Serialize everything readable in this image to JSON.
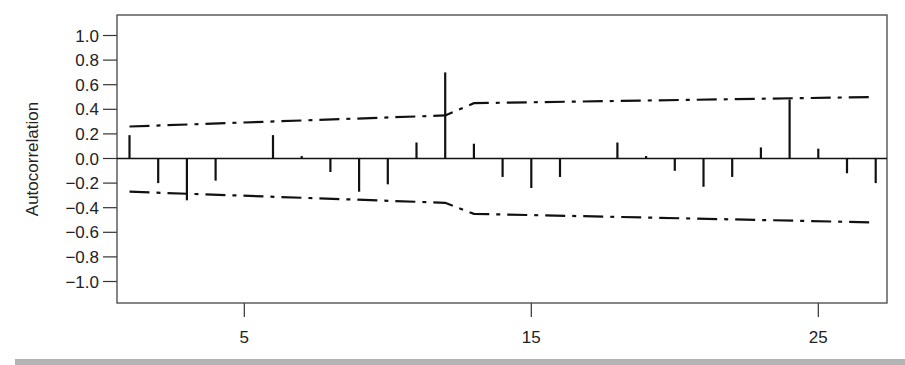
{
  "chart_data": {
    "type": "bar",
    "subtype": "acf-stem",
    "title": "",
    "xlabel": "",
    "ylabel": "Autocorrelation",
    "ylim": [
      -1.1,
      1.1
    ],
    "xlim": [
      0.5,
      27.4
    ],
    "yticks": [
      1.0,
      0.8,
      0.6,
      0.4,
      0.2,
      0.0,
      -0.2,
      -0.4,
      -0.6,
      -0.8,
      -1.0
    ],
    "ytick_labels": [
      "1.0",
      "0.8",
      "0.6",
      "0.4",
      "0.2",
      "0.0",
      "−0.2",
      "−0.4",
      "−0.6",
      "−0.8",
      "−1.0"
    ],
    "xticks": [
      5,
      15,
      25
    ],
    "xtick_labels": [
      "5",
      "15",
      "25"
    ],
    "grid": false,
    "legend": null,
    "lags": [
      1,
      2,
      3,
      4,
      5,
      6,
      7,
      8,
      9,
      10,
      11,
      12,
      13,
      14,
      15,
      16,
      17,
      18,
      19,
      20,
      21,
      22,
      23,
      24,
      25,
      26,
      27
    ],
    "values": [
      0.19,
      -0.2,
      -0.34,
      -0.18,
      0.0,
      0.19,
      0.02,
      -0.11,
      -0.27,
      -0.21,
      0.13,
      0.7,
      0.12,
      -0.15,
      -0.24,
      -0.15,
      0.0,
      0.13,
      0.02,
      -0.1,
      -0.23,
      -0.15,
      0.09,
      0.48,
      0.08,
      -0.12,
      -0.2
    ],
    "confidence_bands": {
      "style": "dash-dot",
      "upper": {
        "x": [
          1,
          12,
          13,
          27
        ],
        "y": [
          0.26,
          0.35,
          0.45,
          0.5
        ]
      },
      "lower": {
        "x": [
          1,
          12,
          13,
          27
        ],
        "y": [
          -0.27,
          -0.36,
          -0.45,
          -0.52
        ]
      }
    }
  },
  "colors": {
    "stem": "#111111",
    "band": "#111111",
    "axis": "#333333",
    "bottom_bar": "#b4b4b4"
  }
}
